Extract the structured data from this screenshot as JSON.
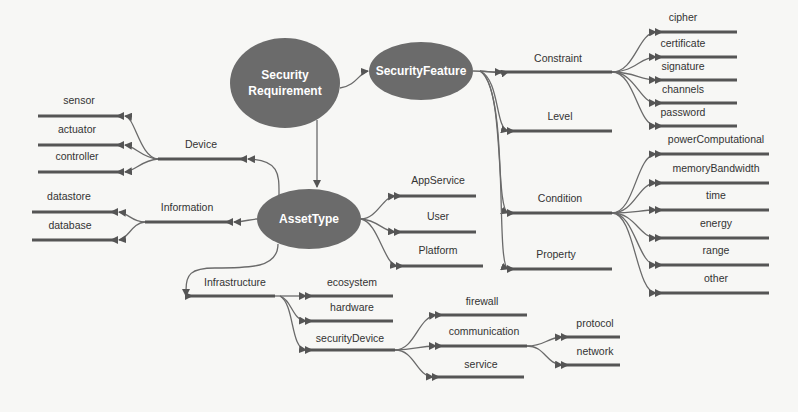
{
  "colors": {
    "node_fill": "#6b6b6b",
    "line": "#666666",
    "bar": "#555555",
    "text": "#333333"
  },
  "ellipses": [
    {
      "id": "sr",
      "text": "Security\nRequirement",
      "cx": 285,
      "cy": 83,
      "rx": 55,
      "ry": 45
    },
    {
      "id": "sf",
      "text": "SecurityFeature",
      "cx": 421,
      "cy": 71,
      "rx": 52,
      "ry": 29
    },
    {
      "id": "at",
      "text": "AssetType",
      "cx": 309,
      "cy": 219,
      "rx": 52,
      "ry": 30
    }
  ],
  "labels": [
    {
      "id": "constraint",
      "text": "Constraint",
      "x": 558,
      "y": 58
    },
    {
      "id": "level",
      "text": "Level",
      "x": 560,
      "y": 116
    },
    {
      "id": "condition",
      "text": "Condition",
      "x": 560,
      "y": 198
    },
    {
      "id": "property",
      "text": "Property",
      "x": 556,
      "y": 254
    },
    {
      "id": "cipher",
      "text": "cipher",
      "x": 683,
      "y": 17
    },
    {
      "id": "certificate",
      "text": "certificate",
      "x": 683,
      "y": 43
    },
    {
      "id": "signature",
      "text": "signature",
      "x": 683,
      "y": 66
    },
    {
      "id": "channels",
      "text": "channels",
      "x": 683,
      "y": 89
    },
    {
      "id": "password",
      "text": "password",
      "x": 683,
      "y": 112
    },
    {
      "id": "powerComputational",
      "text": "powerComputational",
      "x": 716,
      "y": 139
    },
    {
      "id": "memoryBandwidth",
      "text": "memoryBandwidth",
      "x": 716,
      "y": 168
    },
    {
      "id": "time",
      "text": "time",
      "x": 716,
      "y": 195
    },
    {
      "id": "energy",
      "text": "energy",
      "x": 716,
      "y": 223
    },
    {
      "id": "range",
      "text": "range",
      "x": 716,
      "y": 250
    },
    {
      "id": "other",
      "text": "other",
      "x": 716,
      "y": 278
    },
    {
      "id": "device",
      "text": "Device",
      "x": 201,
      "y": 144
    },
    {
      "id": "information",
      "text": "Information",
      "x": 187,
      "y": 207
    },
    {
      "id": "sensor",
      "text": "sensor",
      "x": 79,
      "y": 100
    },
    {
      "id": "actuator",
      "text": "actuator",
      "x": 77,
      "y": 129
    },
    {
      "id": "controller",
      "text": "controller",
      "x": 77,
      "y": 156
    },
    {
      "id": "datastore",
      "text": "datastore",
      "x": 69,
      "y": 196
    },
    {
      "id": "database",
      "text": "database",
      "x": 70,
      "y": 225
    },
    {
      "id": "appservice",
      "text": "AppService",
      "x": 438,
      "y": 180
    },
    {
      "id": "user",
      "text": "User",
      "x": 438,
      "y": 216
    },
    {
      "id": "platform",
      "text": "Platform",
      "x": 438,
      "y": 250
    },
    {
      "id": "infrastructure",
      "text": "Infrastructure",
      "x": 235,
      "y": 282
    },
    {
      "id": "ecosystem",
      "text": "ecosystem",
      "x": 352,
      "y": 282
    },
    {
      "id": "hardware",
      "text": "hardware",
      "x": 352,
      "y": 307
    },
    {
      "id": "securityDevice",
      "text": "securityDevice",
      "x": 350,
      "y": 338
    },
    {
      "id": "firewall",
      "text": "firewall",
      "x": 482,
      "y": 301
    },
    {
      "id": "communication",
      "text": "communication",
      "x": 484,
      "y": 331
    },
    {
      "id": "service",
      "text": "service",
      "x": 481,
      "y": 364
    },
    {
      "id": "protocol",
      "text": "protocol",
      "x": 595,
      "y": 323
    },
    {
      "id": "network",
      "text": "network",
      "x": 595,
      "y": 351
    }
  ],
  "bars": [
    {
      "x1": 496,
      "x2": 612,
      "y": 72,
      "arrow": "left"
    },
    {
      "x1": 508,
      "x2": 612,
      "y": 131,
      "arrow": "left"
    },
    {
      "x1": 508,
      "x2": 612,
      "y": 213,
      "arrow": "left"
    },
    {
      "x1": 508,
      "x2": 612,
      "y": 269,
      "arrow": "left"
    },
    {
      "x1": 656,
      "x2": 737,
      "y": 32,
      "arrow": "left"
    },
    {
      "x1": 656,
      "x2": 737,
      "y": 57,
      "arrow": "left"
    },
    {
      "x1": 656,
      "x2": 737,
      "y": 80,
      "arrow": "left"
    },
    {
      "x1": 656,
      "x2": 737,
      "y": 103,
      "arrow": "left"
    },
    {
      "x1": 656,
      "x2": 737,
      "y": 126,
      "arrow": "left"
    },
    {
      "x1": 656,
      "x2": 769,
      "y": 154,
      "arrow": "left"
    },
    {
      "x1": 656,
      "x2": 769,
      "y": 183,
      "arrow": "left"
    },
    {
      "x1": 656,
      "x2": 769,
      "y": 210,
      "arrow": "left"
    },
    {
      "x1": 656,
      "x2": 769,
      "y": 238,
      "arrow": "left"
    },
    {
      "x1": 656,
      "x2": 769,
      "y": 265,
      "arrow": "left"
    },
    {
      "x1": 656,
      "x2": 769,
      "y": 293,
      "arrow": "left"
    },
    {
      "x1": 158,
      "x2": 246,
      "y": 159,
      "arrow": "right"
    },
    {
      "x1": 145,
      "x2": 232,
      "y": 222,
      "arrow": "right"
    },
    {
      "x1": 38,
      "x2": 123,
      "y": 116,
      "arrow": "right"
    },
    {
      "x1": 38,
      "x2": 123,
      "y": 145,
      "arrow": "right"
    },
    {
      "x1": 38,
      "x2": 123,
      "y": 172,
      "arrow": "right"
    },
    {
      "x1": 32,
      "x2": 117,
      "y": 212,
      "arrow": "right"
    },
    {
      "x1": 32,
      "x2": 117,
      "y": 240,
      "arrow": "right"
    },
    {
      "x1": 395,
      "x2": 476,
      "y": 196,
      "arrow": "left"
    },
    {
      "x1": 395,
      "x2": 476,
      "y": 232,
      "arrow": "left"
    },
    {
      "x1": 397,
      "x2": 483,
      "y": 266,
      "arrow": "left"
    },
    {
      "x1": 186,
      "x2": 275,
      "y": 296,
      "arrow": "left"
    },
    {
      "x1": 306,
      "x2": 393,
      "y": 296,
      "arrow": "left"
    },
    {
      "x1": 306,
      "x2": 393,
      "y": 321,
      "arrow": "left"
    },
    {
      "x1": 306,
      "x2": 395,
      "y": 350,
      "arrow": "left"
    },
    {
      "x1": 436,
      "x2": 527,
      "y": 315,
      "arrow": "left"
    },
    {
      "x1": 436,
      "x2": 527,
      "y": 346,
      "arrow": "left"
    },
    {
      "x1": 433,
      "x2": 524,
      "y": 377,
      "arrow": "left"
    },
    {
      "x1": 562,
      "x2": 620,
      "y": 337,
      "arrow": "left"
    },
    {
      "x1": 562,
      "x2": 620,
      "y": 365,
      "arrow": "left"
    }
  ]
}
